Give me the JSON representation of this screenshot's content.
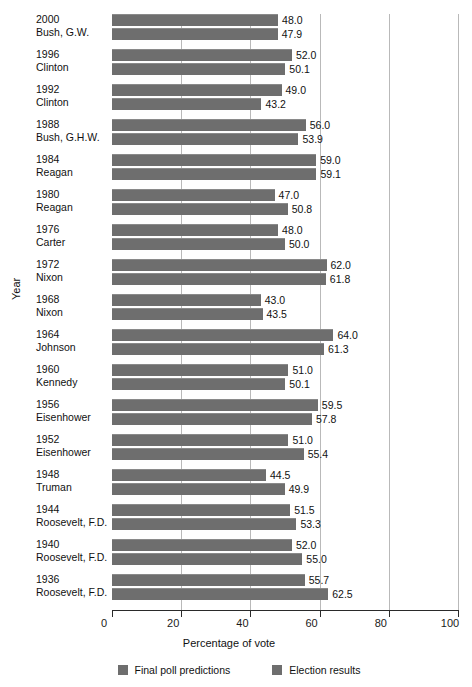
{
  "chart_data": {
    "type": "bar",
    "orientation": "horizontal",
    "title": "",
    "xlabel": "Percentage of vote",
    "ylabel": "Year",
    "xlim": [
      0,
      100
    ],
    "xticks": [
      0,
      20,
      40,
      60,
      80,
      100
    ],
    "grid": true,
    "legend_position": "bottom",
    "categories": [
      "2000 Bush, G.W.",
      "1996 Clinton",
      "1992 Clinton",
      "1988 Bush, G.H.W.",
      "1984 Reagan",
      "1980 Reagan",
      "1976 Carter",
      "1972 Nixon",
      "1968 Nixon",
      "1964 Johnson",
      "1960 Kennedy",
      "1956 Eisenhower",
      "1952 Eisenhower",
      "1948 Truman",
      "1944 Roosevelt, F.D.",
      "1940 Roosevelt, F.D.",
      "1936 Roosevelt, F.D."
    ],
    "series": [
      {
        "name": "Final poll predictions",
        "values": [
          48.0,
          52.0,
          49.0,
          56.0,
          59.0,
          47.0,
          48.0,
          62.0,
          43.0,
          64.0,
          51.0,
          59.5,
          51.0,
          44.5,
          51.5,
          52.0,
          55.7
        ]
      },
      {
        "name": "Election results",
        "values": [
          47.9,
          50.1,
          43.2,
          53.9,
          59.1,
          50.8,
          50.0,
          61.8,
          43.5,
          61.3,
          50.1,
          57.8,
          55.4,
          49.9,
          53.3,
          55.0,
          62.5
        ]
      }
    ],
    "bar_color": "#6e6e6e"
  },
  "rows": [
    {
      "year": "2000",
      "name": "Bush, G.W.",
      "poll": "48.0",
      "result": "47.9"
    },
    {
      "year": "1996",
      "name": "Clinton",
      "poll": "52.0",
      "result": "50.1"
    },
    {
      "year": "1992",
      "name": "Clinton",
      "poll": "49.0",
      "result": "43.2"
    },
    {
      "year": "1988",
      "name": "Bush, G.H.W.",
      "poll": "56.0",
      "result": "53.9"
    },
    {
      "year": "1984",
      "name": "Reagan",
      "poll": "59.0",
      "result": "59.1"
    },
    {
      "year": "1980",
      "name": "Reagan",
      "poll": "47.0",
      "result": "50.8"
    },
    {
      "year": "1976",
      "name": "Carter",
      "poll": "48.0",
      "result": "50.0"
    },
    {
      "year": "1972",
      "name": "Nixon",
      "poll": "62.0",
      "result": "61.8"
    },
    {
      "year": "1968",
      "name": "Nixon",
      "poll": "43.0",
      "result": "43.5"
    },
    {
      "year": "1964",
      "name": "Johnson",
      "poll": "64.0",
      "result": "61.3"
    },
    {
      "year": "1960",
      "name": "Kennedy",
      "poll": "51.0",
      "result": "50.1"
    },
    {
      "year": "1956",
      "name": "Eisenhower",
      "poll": "59.5",
      "result": "57.8"
    },
    {
      "year": "1952",
      "name": "Eisenhower",
      "poll": "51.0",
      "result": "55.4"
    },
    {
      "year": "1948",
      "name": "Truman",
      "poll": "44.5",
      "result": "49.9"
    },
    {
      "year": "1944",
      "name": "Roosevelt, F.D.",
      "poll": "51.5",
      "result": "53.3"
    },
    {
      "year": "1940",
      "name": "Roosevelt, F.D.",
      "poll": "52.0",
      "result": "55.0"
    },
    {
      "year": "1936",
      "name": "Roosevelt, F.D.",
      "poll": "55.7",
      "result": "62.5"
    }
  ],
  "axis": {
    "x_title": "Percentage of vote",
    "y_title": "Year",
    "ticks": [
      "0",
      "20",
      "40",
      "60",
      "80",
      "100"
    ]
  },
  "legend": [
    {
      "label": "Final poll predictions"
    },
    {
      "label": "Election results"
    }
  ]
}
